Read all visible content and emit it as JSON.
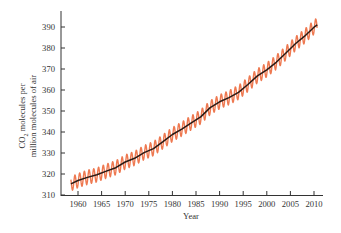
{
  "chart_data": {
    "type": "line",
    "title": "",
    "xlabel": "Year",
    "ylabel_line1": "CO2 molecules per",
    "ylabel_line1_base": "CO",
    "ylabel_line1_sub": "2",
    "ylabel_line1_rest": " molecules per",
    "ylabel_line2": "million molecules of air",
    "xlim": [
      1956.5,
      2012.5
    ],
    "ylim": [
      310,
      397
    ],
    "xticks": [
      1960,
      1965,
      1970,
      1975,
      1980,
      1985,
      1990,
      1995,
      2000,
      2005,
      2010
    ],
    "yticks": [
      310,
      320,
      330,
      340,
      350,
      360,
      370,
      380,
      390
    ],
    "grid": false,
    "legend": "none",
    "series": [
      {
        "name": "Annual trend",
        "color": "#2a1a14",
        "x": [
          1958.5,
          1960,
          1962,
          1964,
          1966,
          1968,
          1970,
          1972,
          1974,
          1976,
          1978,
          1980,
          1982,
          1984,
          1986,
          1988,
          1990,
          1992,
          1994,
          1996,
          1998,
          2000,
          2002,
          2004,
          2006,
          2008,
          2010,
          2010.7
        ],
        "values": [
          315.3,
          316.9,
          318.4,
          319.6,
          321.4,
          323.0,
          325.7,
          327.5,
          330.2,
          332.1,
          335.4,
          338.8,
          341.4,
          344.4,
          347.2,
          351.6,
          354.4,
          356.4,
          358.9,
          362.6,
          366.7,
          369.6,
          373.2,
          377.5,
          381.9,
          385.6,
          389.9,
          391.0
        ]
      },
      {
        "name": "Monthly (seasonal cycle)",
        "color": "#e8623a",
        "seasonal_amplitude_ppm": 3.4
      }
    ]
  },
  "axis_labels": {
    "x": "Year"
  }
}
